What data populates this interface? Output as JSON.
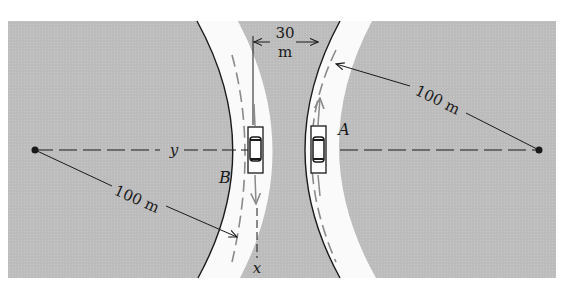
{
  "figure": {
    "type": "engineering-dynamics diagram"
  },
  "colors": {
    "background": "#ffffff",
    "ground": "#bdbdbd",
    "road": "#fafafa",
    "ink": "#1a1a1a",
    "lane_dash": "#8a8a8a"
  },
  "labels": {
    "gap_value": "30",
    "gap_unit": "m",
    "radius_right": "100 m",
    "radius_left": "100 m",
    "car_a": "A",
    "car_b": "B",
    "axis_y": "y",
    "axis_x": "x"
  },
  "dimensions": {
    "road_separation_m": 30,
    "radius_m": 100
  }
}
